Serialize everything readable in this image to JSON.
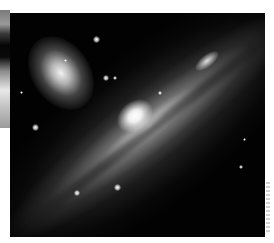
{
  "image": {
    "subject": "edge-on spiral galaxy with elliptical companion galaxy",
    "alt": "Astronomical photograph of an edge-on spiral galaxy crossing diagonally with a smaller elliptical galaxy in the upper left",
    "colors": {
      "background": "#020202",
      "page": "#ffffff",
      "core": "#ffffff"
    }
  }
}
